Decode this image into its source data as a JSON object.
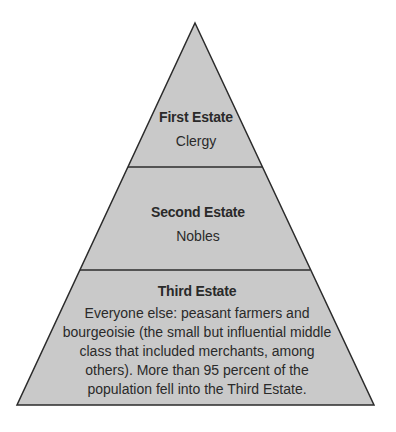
{
  "diagram": {
    "type": "pyramid",
    "colors": {
      "fill": "#c9c9c9",
      "stroke": "#2b2b2b",
      "text": "#2a2a2a",
      "background": "#ffffff"
    },
    "tiers": [
      {
        "title": "First Estate",
        "body": "Clergy"
      },
      {
        "title": "Second Estate",
        "body": "Nobles"
      },
      {
        "title": "Third Estate",
        "body": "Everyone else: peasant farmers and bourgeoisie (the small but influential middle class that included merchants, among others). More than 95 percent of the population fell into the Third Estate."
      }
    ]
  }
}
